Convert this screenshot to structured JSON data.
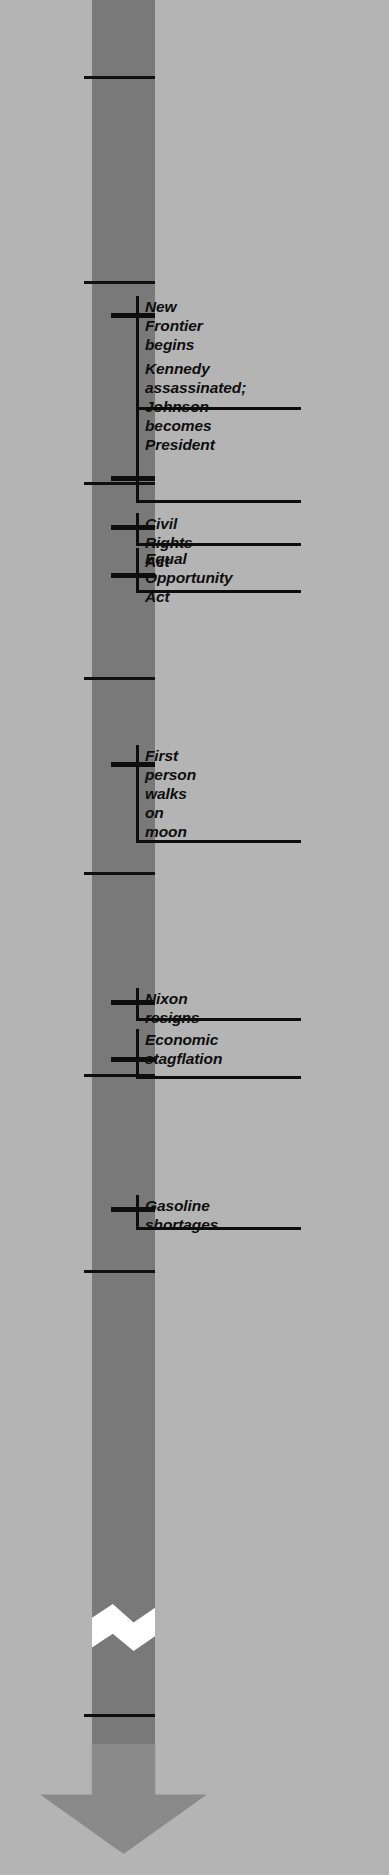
{
  "chart_data": {
    "type": "timeline",
    "orientation": "vertical",
    "axis_range": [
      1955,
      2000
    ],
    "axis_break": {
      "present": true,
      "style": "zigzag",
      "between": [
        1987,
        1998
      ]
    },
    "arrow_direction": "down",
    "colors": {
      "background": "#b4b4b4",
      "bar": "#797979",
      "arrowhead": "#8a8a8a",
      "break": "#ffffff",
      "ink": "#0d0d0d"
    },
    "tick_labels": [
      "1955",
      "1960",
      "1965",
      "1970",
      "1975",
      "1980",
      "1985",
      "2000"
    ],
    "tick_values": [
      1955,
      1960,
      1965,
      1970,
      1975,
      1980,
      1985,
      2000
    ],
    "tick_y": [
      76,
      281,
      482,
      677,
      872,
      1074,
      1270,
      1714
    ],
    "events": [
      {
        "label": "New Frontier\nbegins",
        "year": 1961,
        "tick_y": 313,
        "top": 296,
        "base_y": 407,
        "lines": 2
      },
      {
        "label": "Kennedy assassinated;\nJohnson becomes\nPresident",
        "year": 1963,
        "tick_y": 476,
        "top": 358,
        "base_y": 500,
        "lines": 3
      },
      {
        "label": "Civil Rights Act",
        "year": 1964,
        "tick_y": 525,
        "top": 513,
        "base_y": 543,
        "lines": 1
      },
      {
        "label": "Equal Opportunity\nAct",
        "year": 1965,
        "tick_y": 573,
        "top": 548,
        "base_y": 590,
        "lines": 2
      },
      {
        "label": "First person walks\non moon",
        "year": 1969,
        "tick_y": 762,
        "top": 745,
        "base_y": 840,
        "lines": 2
      },
      {
        "label": "Nixon resigns",
        "year": 1974,
        "tick_y": 1000,
        "top": 988,
        "base_y": 1018,
        "lines": 1
      },
      {
        "label": "Economic\nstagflation",
        "year": 1975,
        "tick_y": 1057,
        "top": 1029,
        "base_y": 1076,
        "lines": 2
      },
      {
        "label": "Gasoline shortages",
        "year": 1979,
        "tick_y": 1207,
        "top": 1195,
        "base_y": 1227,
        "lines": 1
      }
    ]
  }
}
